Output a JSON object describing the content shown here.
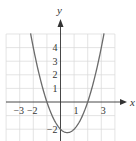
{
  "chart_data": {
    "type": "line",
    "title": "",
    "xlabel": "x",
    "ylabel": "y",
    "function": "y = x^2 - x - 2",
    "x_tick_labels": [
      {
        "value": -3,
        "label": "−3"
      },
      {
        "value": -2,
        "label": "−2"
      },
      {
        "value": 1,
        "label": "1"
      },
      {
        "value": 3,
        "label": "3"
      }
    ],
    "y_tick_labels": [
      {
        "value": 4,
        "label": "4"
      },
      {
        "value": 3,
        "label": "3"
      },
      {
        "value": 2,
        "label": "2"
      },
      {
        "value": 1,
        "label": "1"
      },
      {
        "value": -2,
        "label": "−2"
      }
    ],
    "xlim": [
      -4,
      4
    ],
    "ylim": [
      -2.8,
      5.2
    ],
    "grid": true,
    "series": [
      {
        "name": "parabola",
        "x": [
          -2.2,
          -2,
          -1.5,
          -1,
          -0.5,
          0,
          0.5,
          1,
          1.5,
          2,
          2.5,
          3,
          3.2
        ],
        "y": [
          5.04,
          4,
          1.75,
          0,
          -1.25,
          -2,
          -2.25,
          -2,
          -1.25,
          0,
          1.75,
          4,
          5.04
        ]
      }
    ],
    "key_points": {
      "x_intercepts": [
        -1,
        2
      ],
      "y_intercept": -2,
      "vertex": [
        0.5,
        -2.25
      ]
    }
  },
  "colors": {
    "grid": "#d9d9d9",
    "axis": "#333333",
    "curve": "#6b6b6b"
  }
}
